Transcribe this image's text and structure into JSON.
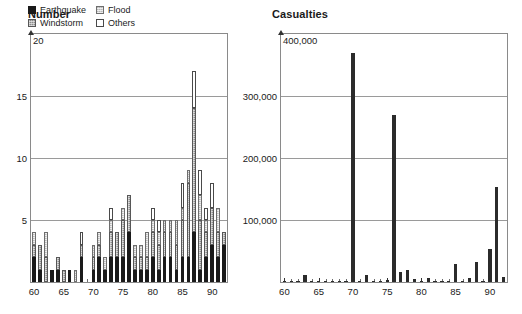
{
  "number_panel": {
    "title": "Number",
    "legend": [
      {
        "label": "Earthquake",
        "swatch": "earthquake-swatch",
        "color": "#1a1a1a"
      },
      {
        "label": "Flood",
        "swatch": "flood-swatch",
        "color": "#cfcfcf"
      },
      {
        "label": "Windstorm",
        "swatch": "windstorm-swatch",
        "color": "#8c8c8c"
      },
      {
        "label": "Others",
        "swatch": "others-swatch",
        "color": "#ffffff"
      }
    ]
  },
  "casualties_panel": {
    "title": "Casualties"
  },
  "chart_data": [
    {
      "type": "bar",
      "title": "Number",
      "stacked": true,
      "xlabel": "",
      "ylabel": "",
      "ylim": [
        0,
        20
      ],
      "yticks": [
        5,
        10,
        15,
        20
      ],
      "ytick_labels": [
        "5",
        "10",
        "15",
        "20"
      ],
      "grid": true,
      "legend_position": "top-left",
      "xlim": [
        59.5,
        92.5
      ],
      "xticks": [
        60,
        65,
        70,
        75,
        80,
        85,
        90
      ],
      "xtick_labels": [
        "60",
        "65",
        "70",
        "75",
        "80",
        "85",
        "90"
      ],
      "categories": [
        60,
        61,
        62,
        63,
        64,
        65,
        66,
        67,
        68,
        69,
        70,
        71,
        72,
        73,
        74,
        75,
        76,
        77,
        78,
        79,
        80,
        81,
        82,
        83,
        84,
        85,
        86,
        87,
        88,
        89,
        90,
        91,
        92
      ],
      "series": [
        {
          "name": "Earthquake",
          "color": "#1a1a1a",
          "values": [
            2,
            1,
            0,
            1,
            1,
            0,
            1,
            0,
            2,
            0,
            1,
            2,
            1,
            2,
            2,
            2,
            4,
            1,
            1,
            1,
            2,
            1,
            2,
            2,
            1,
            2,
            2,
            4,
            1,
            2,
            3,
            2,
            3
          ]
        },
        {
          "name": "Windstorm",
          "color": "#8c8c8c",
          "values": [
            1,
            2,
            2,
            0,
            1,
            1,
            0,
            0,
            1,
            0,
            1,
            1,
            0,
            2,
            2,
            3,
            3,
            1,
            1,
            1,
            2,
            2,
            2,
            2,
            2,
            3,
            6,
            10,
            4,
            2,
            3,
            2,
            1
          ]
        },
        {
          "name": "Flood",
          "color": "#cfcfcf",
          "values": [
            1,
            0,
            2,
            0,
            0,
            0,
            0,
            1,
            0,
            0,
            1,
            1,
            1,
            1,
            0,
            1,
            0,
            1,
            1,
            2,
            1,
            1,
            1,
            1,
            2,
            1,
            1,
            0,
            2,
            1,
            0,
            2,
            0
          ]
        },
        {
          "name": "Others",
          "color": "#ffffff",
          "values": [
            0,
            0,
            0,
            0,
            0,
            0,
            0,
            0,
            1,
            0,
            0,
            0,
            0,
            1,
            0,
            0,
            0,
            0,
            0,
            0,
            1,
            1,
            0,
            0,
            0,
            2,
            0,
            3,
            2,
            1,
            2,
            0,
            0
          ]
        }
      ]
    },
    {
      "type": "bar",
      "title": "Casualties",
      "stacked": false,
      "xlabel": "",
      "ylabel": "",
      "ylim": [
        0,
        400000
      ],
      "yticks": [
        100000,
        200000,
        300000,
        400000
      ],
      "ytick_labels": [
        "100,000",
        "200,000",
        "300,000",
        "400,000"
      ],
      "grid": true,
      "xlim": [
        59.5,
        92.5
      ],
      "xticks": [
        60,
        65,
        70,
        75,
        80,
        85,
        90
      ],
      "xtick_labels": [
        "60",
        "65",
        "70",
        "75",
        "80",
        "85",
        "90"
      ],
      "categories": [
        60,
        61,
        62,
        63,
        64,
        65,
        66,
        67,
        68,
        69,
        70,
        71,
        72,
        73,
        74,
        75,
        76,
        77,
        78,
        79,
        80,
        81,
        82,
        83,
        84,
        85,
        86,
        87,
        88,
        89,
        90,
        91,
        92
      ],
      "values": [
        2000,
        1000,
        1000,
        12000,
        1500,
        1000,
        1000,
        1000,
        1500,
        1000,
        370000,
        1500,
        11000,
        2000,
        2000,
        3000,
        270000,
        16000,
        20000,
        5000,
        2000,
        6000,
        1000,
        2000,
        2000,
        29000,
        2000,
        6000,
        33000,
        2000,
        53000,
        153000,
        8000
      ],
      "color": "#2b2b2b"
    }
  ]
}
